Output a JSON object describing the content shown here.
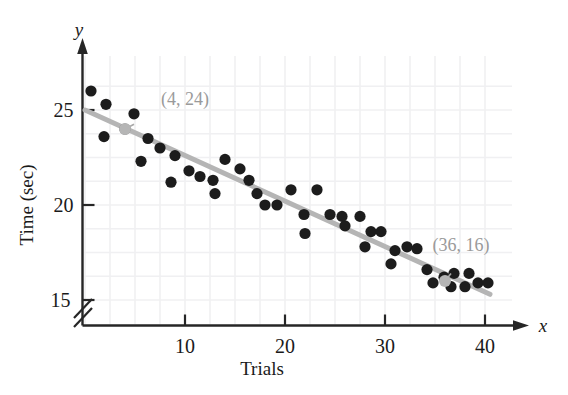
{
  "chart_data": {
    "type": "scatter",
    "title": "",
    "xlabel": "Trials",
    "ylabel": "Time (sec)",
    "x_var": "x",
    "y_var": "y",
    "xlim": [
      0,
      42
    ],
    "ylim": [
      15,
      26.6
    ],
    "xticks": [
      10,
      20,
      30,
      40
    ],
    "yticks": [
      15,
      20,
      25
    ],
    "xtick_labels": [
      "10",
      "20",
      "30",
      "40"
    ],
    "ytick_labels": [
      "15",
      "20",
      "25"
    ],
    "grid": true,
    "grid_color": "#f0f0f2",
    "axis_break": "y-axis broken below 15",
    "point_color": "#1c1c1c",
    "line_color": "#b5b5b5",
    "points": [
      [
        0.6,
        26.0
      ],
      [
        2.1,
        25.3
      ],
      [
        4.0,
        24.0
      ],
      [
        1.9,
        23.6
      ],
      [
        4.9,
        24.8
      ],
      [
        6.3,
        23.5
      ],
      [
        7.5,
        23.0
      ],
      [
        5.6,
        22.3
      ],
      [
        9.0,
        22.6
      ],
      [
        10.4,
        21.8
      ],
      [
        11.5,
        21.5
      ],
      [
        8.6,
        21.2
      ],
      [
        12.8,
        21.3
      ],
      [
        14.0,
        22.4
      ],
      [
        13.0,
        20.6
      ],
      [
        15.5,
        21.9
      ],
      [
        16.4,
        21.3
      ],
      [
        18.0,
        20.0
      ],
      [
        19.2,
        20.0
      ],
      [
        17.2,
        20.6
      ],
      [
        20.6,
        20.8
      ],
      [
        21.9,
        19.5
      ],
      [
        23.2,
        20.8
      ],
      [
        22.0,
        18.5
      ],
      [
        24.5,
        19.5
      ],
      [
        25.7,
        19.4
      ],
      [
        26.0,
        18.9
      ],
      [
        27.5,
        19.4
      ],
      [
        28.6,
        18.6
      ],
      [
        29.6,
        18.6
      ],
      [
        28.0,
        17.8
      ],
      [
        31.0,
        17.6
      ],
      [
        32.2,
        17.8
      ],
      [
        33.2,
        17.7
      ],
      [
        30.6,
        16.9
      ],
      [
        34.2,
        16.6
      ],
      [
        35.9,
        16.2
      ],
      [
        36.9,
        16.4
      ],
      [
        38.4,
        16.4
      ],
      [
        34.8,
        15.9
      ],
      [
        36.6,
        15.7
      ],
      [
        38.0,
        15.7
      ],
      [
        39.3,
        15.9
      ],
      [
        40.3,
        15.9
      ]
    ],
    "fit_line": {
      "label": "least squares regression line",
      "x_start": 0,
      "y_start": 25.0,
      "x_end": 40.5,
      "y_end": 15.3
    },
    "annotations": [
      {
        "label": "(4, 24)",
        "x": 4,
        "y": 24,
        "leader_from_x": 4.9,
        "leader_from_y": 24.25,
        "label_x": 10.0,
        "label_y": 25.25
      },
      {
        "label": "(36, 16)",
        "x": 36,
        "y": 16,
        "leader_from_x": 36.6,
        "leader_from_y": 16.4,
        "label_x": 37.6,
        "label_y": 17.6
      }
    ]
  }
}
